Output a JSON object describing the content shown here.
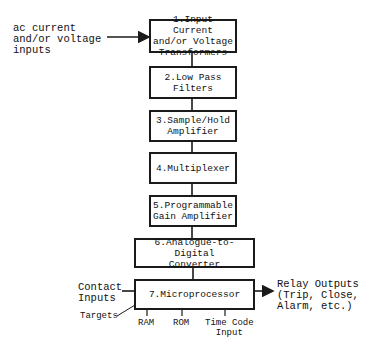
{
  "diagram": {
    "type": "block-diagram",
    "blocks": [
      {
        "id": 1,
        "label": "1.Input Current\nand/or Voltage\nTransformers"
      },
      {
        "id": 2,
        "label": "2.Low Pass\nFilters"
      },
      {
        "id": 3,
        "label": "3.Sample/Hold\nAmplifier"
      },
      {
        "id": 4,
        "label": "4.Multiplexer"
      },
      {
        "id": 5,
        "label": "5.Programmable\nGain Amplifier"
      },
      {
        "id": 6,
        "label": "6.Analogue-to-Digital\nConverter"
      },
      {
        "id": 7,
        "label": "7.Microprocessor"
      }
    ],
    "external_labels": {
      "ac_inputs": "ac current\nand/or voltage\ninputs",
      "contact_inputs": "Contact\nInputs",
      "targets": "Targets",
      "relay_outputs": "Relay Outputs\n(Trip, Close,\nAlarm, etc.)",
      "ram": "RAM",
      "rom": "ROM",
      "time_code": "Time Code\nInput"
    },
    "edges": [
      {
        "from": "ac_inputs",
        "to": 1,
        "arrow": true
      },
      {
        "from": 1,
        "to": 2
      },
      {
        "from": 2,
        "to": 3
      },
      {
        "from": 3,
        "to": 4
      },
      {
        "from": 4,
        "to": 5
      },
      {
        "from": 5,
        "to": 6
      },
      {
        "from": 6,
        "to": 7
      },
      {
        "from": "contact_inputs",
        "to": 7
      },
      {
        "from": 7,
        "to": "targets"
      },
      {
        "from": 7,
        "to": "relay_outputs",
        "arrow": true
      },
      {
        "from": 7,
        "to": "ram"
      },
      {
        "from": 7,
        "to": "rom"
      },
      {
        "from": 7,
        "to": "time_code"
      }
    ]
  }
}
